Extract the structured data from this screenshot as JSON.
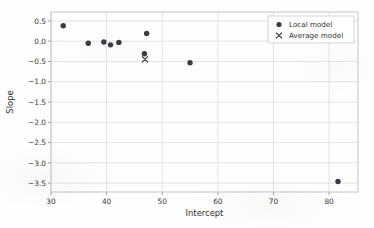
{
  "chart_data": {
    "type": "scatter",
    "title": "",
    "xlabel": "Intercept",
    "ylabel": "Slope",
    "xlim": [
      30.0,
      85.2
    ],
    "ylim": [
      -3.72,
      0.72
    ],
    "xticks": [
      30,
      40,
      50,
      60,
      70,
      80
    ],
    "yticks": [
      0.5,
      0.0,
      -0.5,
      -1.0,
      -1.5,
      -2.0,
      -2.5,
      -3.0,
      -3.5
    ],
    "xticklabels": [
      "30",
      "40",
      "50",
      "60",
      "70",
      "80"
    ],
    "yticklabels": [
      "0.5",
      "0.0",
      "−0.5",
      "−1.0",
      "−1.5",
      "−2.0",
      "−2.5",
      "−3.0",
      "−3.5"
    ],
    "grid": true,
    "grid_color": "#d8d8d8",
    "legend_position": "upper right",
    "series": [
      {
        "name": "Local model",
        "marker": "circle",
        "color": "#3b3b46",
        "points": [
          {
            "x": 32.2,
            "y": 0.38
          },
          {
            "x": 36.7,
            "y": -0.05
          },
          {
            "x": 39.5,
            "y": -0.02
          },
          {
            "x": 40.7,
            "y": -0.09
          },
          {
            "x": 42.2,
            "y": -0.03
          },
          {
            "x": 47.2,
            "y": 0.19
          },
          {
            "x": 46.8,
            "y": -0.31
          },
          {
            "x": 55.0,
            "y": -0.53
          },
          {
            "x": 81.6,
            "y": -3.46
          }
        ]
      },
      {
        "name": "Average model",
        "marker": "x",
        "color": "#55555f",
        "points": [
          {
            "x": 46.9,
            "y": -0.45
          }
        ]
      }
    ]
  },
  "legend": {
    "entries": [
      {
        "label": "Local model",
        "marker": "circle"
      },
      {
        "label": "Average model",
        "marker": "x"
      }
    ]
  },
  "axes": {
    "x_title": "Intercept",
    "y_title": "Slope"
  }
}
